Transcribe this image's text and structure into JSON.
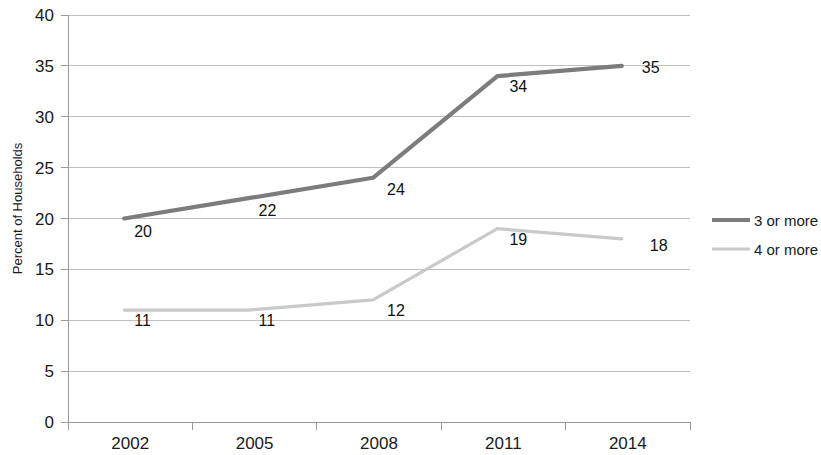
{
  "chart_data": {
    "type": "line",
    "title": "",
    "xlabel": "",
    "ylabel": "Percent of Households",
    "categories": [
      "2002",
      "2005",
      "2008",
      "2011",
      "2014"
    ],
    "series": [
      {
        "name": "3 or more",
        "color": "#7c7c7c",
        "values": [
          20,
          22,
          24,
          34,
          35
        ],
        "labels": [
          "20",
          "22",
          "24",
          "34",
          "35"
        ]
      },
      {
        "name": "4 or more",
        "color": "#c9c9c9",
        "values": [
          11,
          11,
          12,
          19,
          18
        ],
        "labels": [
          "11",
          "11",
          "12",
          "19",
          "18"
        ]
      }
    ],
    "ylim": [
      0,
      40
    ],
    "yticks": [
      "0",
      "5",
      "10",
      "15",
      "20",
      "25",
      "30",
      "35",
      "40"
    ],
    "ytick_values": [
      0,
      5,
      10,
      15,
      20,
      25,
      30,
      35,
      40
    ],
    "grid": true,
    "grid_color": "#bfbfbf",
    "axis_color": "#9a9a9a",
    "legend_position": "right"
  },
  "legend": {
    "items": [
      {
        "label": "3 or more",
        "color": "#7c7c7c"
      },
      {
        "label": "4 or more",
        "color": "#c9c9c9"
      }
    ]
  }
}
